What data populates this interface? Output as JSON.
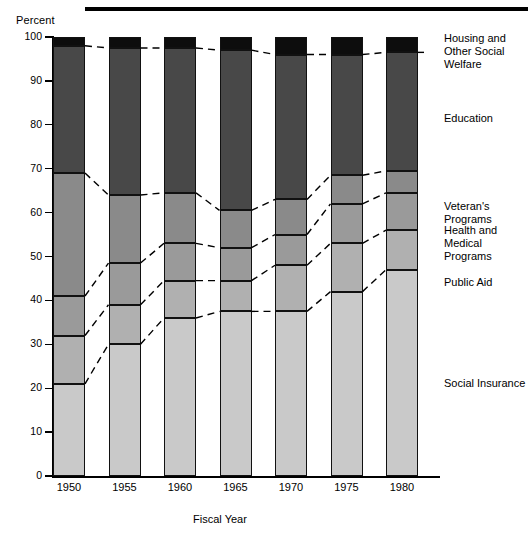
{
  "chart_data": {
    "type": "bar",
    "subtype": "stacked-bar-100-percent",
    "title": "",
    "xlabel": "Fiscal Year",
    "ylabel": "Percent",
    "categories": [
      "1950",
      "1955",
      "1960",
      "1965",
      "1970",
      "1975",
      "1980"
    ],
    "ylim": [
      0,
      100
    ],
    "yticks": [
      "0",
      "10",
      "20",
      "30",
      "40",
      "50",
      "60",
      "70",
      "80",
      "90",
      "100"
    ],
    "grid": false,
    "legend_position": "right-inline",
    "annotations": "Dashed leader lines connect matching segment boundaries between adjacent bars.",
    "series": [
      {
        "name": "Social Insurance",
        "color": "#c9c9c9",
        "values": [
          21,
          30,
          36,
          37.5,
          37.5,
          42,
          47
        ],
        "cumulative_top": [
          21,
          30,
          36,
          37.5,
          37.5,
          42,
          47
        ]
      },
      {
        "name": "Public Aid",
        "color": "#b0b0b0",
        "values": [
          11,
          9,
          8.5,
          7,
          10.5,
          11,
          9
        ],
        "cumulative_top": [
          32,
          39,
          44.5,
          44.5,
          48,
          53,
          56
        ]
      },
      {
        "name": "Health and Medical Programs",
        "color": "#9a9a9a",
        "values": [
          9,
          9.5,
          8.5,
          7.5,
          7,
          9,
          8.5
        ],
        "cumulative_top": [
          41,
          48.5,
          53,
          52,
          55,
          62,
          64.5
        ]
      },
      {
        "name": "Veteran's Programs",
        "color": "#8a8a8a",
        "values": [
          28,
          15.5,
          11.5,
          8.5,
          8,
          6.5,
          5
        ],
        "cumulative_top": [
          69,
          64,
          64.5,
          60.5,
          63,
          68.5,
          69.5
        ]
      },
      {
        "name": "Education",
        "color": "#484848",
        "values": [
          29,
          33.5,
          33,
          36.5,
          33,
          27.5,
          27
        ],
        "cumulative_top": [
          98,
          97.5,
          97.5,
          97,
          96,
          96,
          96.5
        ]
      },
      {
        "name": "Housing and Other Social Welfare",
        "color": "#0d0d0d",
        "values": [
          2,
          2.5,
          2.5,
          3,
          4,
          4,
          3.5
        ],
        "cumulative_top": [
          100,
          100,
          100,
          100,
          100,
          100,
          100
        ]
      }
    ]
  },
  "legend": {
    "items": [
      {
        "label": "Housing and\nOther Social Welfare",
        "top_px": 32
      },
      {
        "label": "Education",
        "top_px": 112
      },
      {
        "label": "Veteran's Programs",
        "top_px": 200
      },
      {
        "label": "Health and\nMedical Programs",
        "top_px": 224
      },
      {
        "label": "Public Aid",
        "top_px": 276
      },
      {
        "label": "Social Insurance",
        "top_px": 377
      }
    ]
  }
}
